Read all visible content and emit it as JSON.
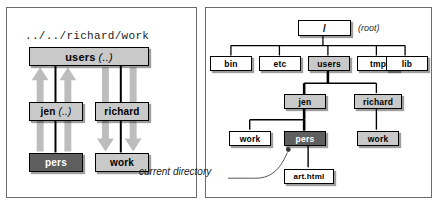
{
  "left_panel": {
    "path_label": "../../richard/work",
    "nodes": {
      "users": {
        "label": "users",
        "annotation": "(..)"
      },
      "jen": {
        "label": "jen",
        "annotation": "(..)"
      },
      "richard": {
        "label": "richard",
        "annotation": ""
      },
      "pers": {
        "label": "pers",
        "annotation": ""
      },
      "work": {
        "label": "work",
        "annotation": ""
      }
    },
    "arrows": {
      "up_direction": "up",
      "down_direction": "down"
    },
    "colors": {
      "box_fill": "#d2d2d2",
      "current_fill": "#5f5f5f",
      "arrow_fill": "#bdbdbd"
    }
  },
  "right_panel": {
    "root": {
      "label": "/",
      "caption": "(root)"
    },
    "level1": [
      {
        "label": "bin",
        "style": "white"
      },
      {
        "label": "etc",
        "style": "white"
      },
      {
        "label": "users",
        "style": "gray"
      },
      {
        "label": "tmp",
        "style": "white"
      },
      {
        "label": "lib",
        "style": "white"
      }
    ],
    "level2": [
      {
        "label": "jen",
        "style": "gray"
      },
      {
        "label": "richard",
        "style": "gray"
      }
    ],
    "level3": [
      {
        "label": "work",
        "style": "white"
      },
      {
        "label": "pers",
        "style": "dark"
      },
      {
        "label": "work",
        "style": "gray"
      }
    ],
    "level4": [
      {
        "label": "art.html",
        "style": "white"
      }
    ],
    "annotation": {
      "text": "current directory",
      "points_to": "pers"
    },
    "colors": {
      "highlight_fill": "#c9c9c9",
      "current_fill": "#5f5f5f",
      "line": "#000000"
    }
  }
}
